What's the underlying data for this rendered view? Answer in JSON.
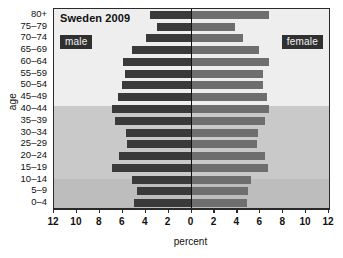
{
  "chart_data": {
    "type": "bar",
    "subtype": "population-pyramid",
    "title": "Sweden 2009",
    "xlabel": "percent",
    "ylabel": "age",
    "xlim": [
      -12,
      12
    ],
    "xticks": [
      12,
      10,
      8,
      6,
      4,
      2,
      0,
      2,
      4,
      6,
      8,
      10,
      12
    ],
    "xtick_values": [
      -12,
      -10,
      -8,
      -6,
      -4,
      -2,
      0,
      2,
      4,
      6,
      8,
      10,
      12
    ],
    "grid": false,
    "legend": {
      "male": "male",
      "female": "female",
      "position": "inside-top"
    },
    "categories": [
      "80+",
      "75–79",
      "70–74",
      "65–69",
      "60–64",
      "55–59",
      "50–54",
      "45–49",
      "40–44",
      "35–39",
      "30–34",
      "25–29",
      "20–24",
      "15–19",
      "10–14",
      "5–9",
      "0–4"
    ],
    "series": [
      {
        "name": "male",
        "values": [
          3.6,
          3.0,
          4.0,
          5.2,
          6.0,
          5.8,
          6.1,
          6.4,
          6.9,
          6.7,
          5.7,
          5.6,
          6.3,
          6.9,
          5.2,
          4.8,
          5.0
        ]
      },
      {
        "name": "female",
        "values": [
          6.8,
          3.8,
          4.5,
          5.9,
          6.8,
          6.2,
          6.2,
          6.6,
          6.8,
          6.4,
          5.8,
          5.7,
          6.4,
          6.7,
          5.2,
          4.9,
          4.8
        ]
      }
    ],
    "colors": {
      "male": "#3a3a3a",
      "female": "#6e6e6e",
      "axis": "#2a2a2a"
    },
    "bands": [
      {
        "from": "80+",
        "to": "45–49",
        "color": "#eeeeee"
      },
      {
        "from": "40–44",
        "to": "15–19",
        "color": "#c9c9c9"
      },
      {
        "from": "10–14",
        "to": "0–4",
        "color": "#bdbdbd"
      }
    ]
  }
}
